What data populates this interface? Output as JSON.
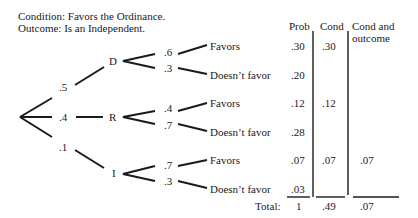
{
  "header": {
    "condition": "Condition: Favors the Ordinance.",
    "outcome": "Outcome: Is an Independent."
  },
  "tree": {
    "first_level": [
      {
        "label": "D",
        "prob": ".5"
      },
      {
        "label": "R",
        "prob": ".4"
      },
      {
        "label": "I",
        "prob": ".1"
      }
    ],
    "second_level": [
      {
        "parent": "D",
        "label": "Favors",
        "prob": ".6"
      },
      {
        "parent": "D",
        "label": "Doesn’t favor",
        "prob": ".3"
      },
      {
        "parent": "R",
        "label": "Favors",
        "prob": ".4"
      },
      {
        "parent": "R",
        "label": "Doesn’t favor",
        "prob": ".7"
      },
      {
        "parent": "I",
        "label": "Favors",
        "prob": ".7"
      },
      {
        "parent": "I",
        "label": "Doesn’t favor",
        "prob": ".3"
      }
    ]
  },
  "table": {
    "columns": [
      "Prob",
      "Cond",
      "Cond and",
      "outcome"
    ],
    "rows": [
      {
        "prob": ".30",
        "cond": ".30",
        "cond_outcome": ""
      },
      {
        "prob": ".20",
        "cond": "",
        "cond_outcome": ""
      },
      {
        "prob": ".12",
        "cond": ".12",
        "cond_outcome": ""
      },
      {
        "prob": ".28",
        "cond": "",
        "cond_outcome": ""
      },
      {
        "prob": ".07",
        "cond": ".07",
        "cond_outcome": ".07"
      },
      {
        "prob": ".03",
        "cond": "",
        "cond_outcome": ""
      }
    ],
    "total_label": "Total:",
    "totals": {
      "prob": "1",
      "cond": ".49",
      "cond_outcome": ".07"
    }
  }
}
